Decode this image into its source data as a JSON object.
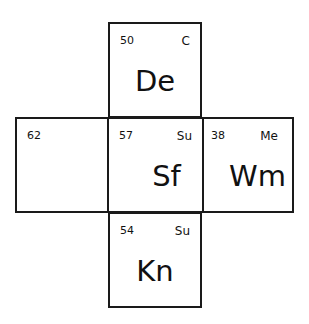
{
  "cells": {
    "top": {
      "number": "50",
      "tag": "C",
      "symbol": "De"
    },
    "left": {
      "number": "62",
      "tag": "",
      "symbol": ""
    },
    "center": {
      "number": "57",
      "tag": "Su",
      "symbol": "Sf"
    },
    "right": {
      "number": "38",
      "tag": "Me",
      "symbol": "Wm"
    },
    "bottom": {
      "number": "54",
      "tag": "Su",
      "symbol": "Kn"
    }
  },
  "colors": {
    "border": "#1a1a1a",
    "background": "#ffffff",
    "text": "#111111"
  }
}
